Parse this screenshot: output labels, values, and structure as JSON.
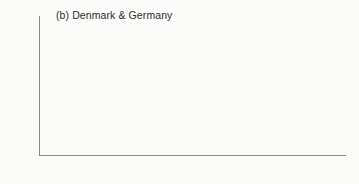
{
  "figure": {
    "panel_title": "(b) Denmark & Germany",
    "background_color": "#fbfbfa",
    "bar_color": "#4a4a4a",
    "axis_color": "#8a8a88",
    "text_color": "#2f2f2f"
  },
  "chart_data": {
    "type": "bar",
    "title": "(b) Denmark & Germany",
    "xlabel": "",
    "ylabel": "",
    "categories": [
      "pre-1950",
      "1950s",
      "1960s",
      "1970s",
      "1980s",
      "1990s"
    ],
    "values": [
      0.5,
      7.0,
      27.5,
      29.5,
      24.5,
      10.8
    ],
    "ylim": [
      0,
      35
    ],
    "yticks": [
      0,
      5,
      10,
      15,
      20,
      25,
      30,
      35
    ],
    "ytick_labels": [
      "0",
      "5",
      "10",
      "15",
      "20",
      "25",
      "30",
      "35"
    ],
    "grid": false,
    "legend": null,
    "series": [
      {
        "name": "Denmark & Germany",
        "values": [
          0.5,
          7.0,
          27.5,
          29.5,
          24.5,
          10.8
        ]
      }
    ]
  }
}
